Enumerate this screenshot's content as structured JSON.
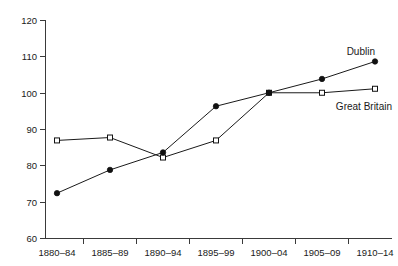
{
  "chart_data": {
    "type": "line",
    "title": "",
    "subtitle": "",
    "xlabel": "",
    "ylabel": "",
    "categories": [
      "1880–84",
      "1885–89",
      "1890–94",
      "1895–99",
      "1900–04",
      "1905–09",
      "1910–14"
    ],
    "series": [
      {
        "name": "Dublin",
        "marker": "filled-circle",
        "values": [
          72.4,
          78.8,
          83.6,
          96.3,
          100.0,
          103.8,
          108.6
        ]
      },
      {
        "name": "Great Britain",
        "marker": "open-square",
        "values": [
          86.9,
          87.7,
          82.2,
          86.9,
          100.0,
          100.0,
          101.1
        ]
      }
    ],
    "ylim": [
      60,
      120
    ],
    "yticks": [
      60,
      70,
      80,
      90,
      100,
      110,
      120
    ],
    "ytick_labels": [
      "60",
      "70",
      "80",
      "90",
      "100",
      "110",
      "120"
    ],
    "xtick_labels": [
      "1880–84",
      "1885–89",
      "1890–94",
      "1895–99",
      "1900–04",
      "1905–09",
      "1910–14"
    ],
    "grid": false,
    "legend_position": "inline-annotations",
    "annotations": [
      {
        "text": "Dublin",
        "series": "Dublin",
        "x_category": "1910–14",
        "placement": "above-left-of-last-point"
      },
      {
        "text": "Great Britain",
        "series": "Great Britain",
        "x_category": "1910–14",
        "placement": "below-left-of-last-point"
      }
    ],
    "colors": {
      "line": "#1a1a1a",
      "axis": "#3a3a3a",
      "text": "#1a1a1a",
      "background": "#ffffff",
      "marker_fill_dublin": "#111111",
      "marker_fill_great_britain": "#ffffff"
    }
  },
  "axes": {
    "y_axis_name": "index-value-axis",
    "x_axis_name": "period-axis"
  }
}
